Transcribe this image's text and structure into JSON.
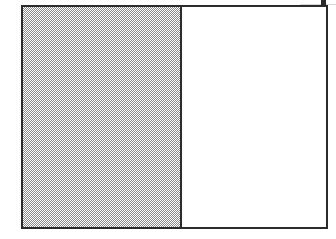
{
  "figure": {
    "title": "",
    "background_color": "#ffffff",
    "frame": {
      "border_color": "#2b2b2b",
      "border_width_px": 2,
      "x": 21,
      "y": 5,
      "width": 307,
      "height": 224
    },
    "panels": [
      {
        "id": "left",
        "label": "",
        "fill": "dither-50",
        "fill_color": "#8a8a8a",
        "width_px": 158,
        "fraction": 0.51
      },
      {
        "id": "right",
        "label": "",
        "fill": "solid",
        "fill_color": "#ffffff",
        "width_px": 147,
        "fraction": 0.49
      }
    ],
    "divider": {
      "color": "#2b2b2b",
      "width_px": 2,
      "x": 178
    },
    "marks": [
      {
        "id": "top-tick",
        "shape": "square",
        "color": "#2b2b2b",
        "x": 321,
        "y": 0,
        "size_px": 5
      }
    ]
  },
  "chart_data": {
    "type": "bar",
    "title": "",
    "subtitle": "",
    "xlabel": "",
    "ylabel": "",
    "categories": [
      "left",
      "right"
    ],
    "values": [
      0.51,
      0.49
    ],
    "series": [
      {
        "name": "fill",
        "values": [
          1,
          0
        ]
      }
    ],
    "legend": [],
    "annotations": [],
    "grid": false,
    "xlim": [
      0,
      1
    ],
    "ylim": [
      0,
      1
    ]
  }
}
